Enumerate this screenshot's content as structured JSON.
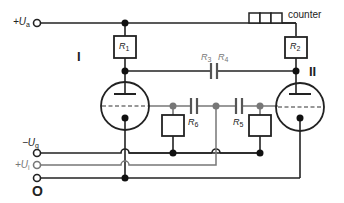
{
  "diagram": {
    "type": "circuit-schematic",
    "colors": {
      "wire": "#222222",
      "secondary_wire": "#888888",
      "junction": "#222222",
      "grey_junction": "#777777",
      "background": "#ffffff"
    },
    "terminals": {
      "supply": {
        "label": "+U",
        "sub": "a"
      },
      "grid_bias": {
        "label": "−U",
        "sub": "g"
      },
      "trigger": {
        "label": "+U",
        "sub": "i"
      },
      "ground": {
        "label": "O"
      }
    },
    "tubes": [
      {
        "id": "tube-I",
        "label": "I"
      },
      {
        "id": "tube-II",
        "label": "II"
      }
    ],
    "components": {
      "R1": {
        "label": "R",
        "sub": "1"
      },
      "R2": {
        "label": "R",
        "sub": "2"
      },
      "R3": {
        "label": "R",
        "sub": "3"
      },
      "R4": {
        "label": "R",
        "sub": "4"
      },
      "R5": {
        "label": "R",
        "sub": "5"
      },
      "R6": {
        "label": "R",
        "sub": "6"
      }
    },
    "counter": {
      "label": "counter"
    }
  }
}
